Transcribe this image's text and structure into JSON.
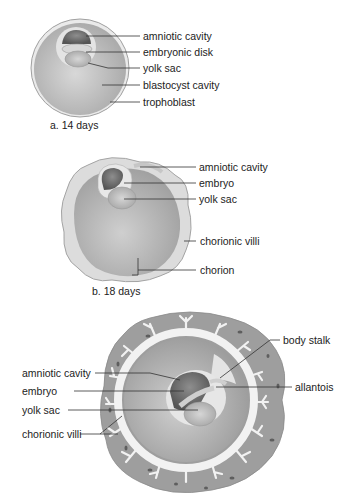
{
  "panels": [
    {
      "id": "a",
      "caption": "a.  14 days",
      "labels": [
        "amniotic cavity",
        "embryonic disk",
        "yolk sac",
        "blastocyst cavity",
        "trophoblast"
      ]
    },
    {
      "id": "b",
      "caption": "b.  18 days",
      "labels": [
        "amniotic cavity",
        "embryo",
        "yolk sac",
        "chorionic villi",
        "chorion"
      ]
    },
    {
      "id": "c",
      "caption": "",
      "labels_left": [
        "amniotic cavity",
        "embryo",
        "yolk sac",
        "chorionic villi"
      ],
      "labels_right": [
        "body stalk",
        "allantois"
      ]
    }
  ],
  "colors": {
    "outer_tissue": "#9a9a9a",
    "cavity": "#c4c4c4",
    "rim": "#e6e6e6",
    "dark": "#6e6e6e",
    "line": "#333333"
  }
}
